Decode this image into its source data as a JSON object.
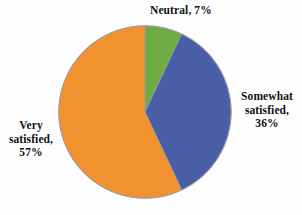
{
  "chart_data": {
    "type": "pie",
    "title": "",
    "categories": [
      "Neutral",
      "Somewhat satisfied",
      "Very satisfied"
    ],
    "values": [
      7,
      36,
      57
    ],
    "units": "%",
    "start_angle_deg": 0,
    "direction": "clockwise",
    "legend_position": "none",
    "grid": false,
    "labels": [
      "Neutral, 7%",
      "Somewhat satisfied, 36%",
      "Very satisfied, 57%"
    ],
    "colors": [
      "#6fad42",
      "#4a5ea8",
      "#f2922f"
    ]
  },
  "figure": {
    "background_color": "#fdfdfd",
    "slice_outline_color": "#9a9a9a",
    "label_text_color": "#121212"
  },
  "labels": {
    "neutral": {
      "line1": "Neutral, 7%",
      "category": "Neutral",
      "percent": "7%"
    },
    "somewhat": {
      "line1": "Somewhat",
      "line2": "satisfied,",
      "line3": "36%",
      "category": "Somewhat satisfied",
      "percent": "36%"
    },
    "very": {
      "line1": "Very",
      "line2": "satisfied,",
      "line3": "57%",
      "category": "Very satisfied",
      "percent": "57%"
    }
  },
  "slices": {
    "neutral": {
      "name": "Neutral",
      "value": 7,
      "color": "#6fad42"
    },
    "somewhat": {
      "name": "Somewhat satisfied",
      "value": 36,
      "color": "#4a5ea8"
    },
    "very": {
      "name": "Very satisfied",
      "value": 57,
      "color": "#f2922f"
    }
  }
}
